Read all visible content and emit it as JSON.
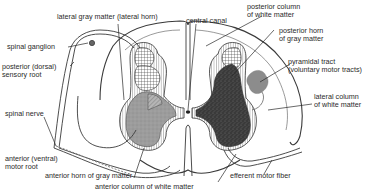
{
  "diagram": {
    "colors": {
      "outline": "#3a3a3a",
      "white_matter": "#ffffff",
      "gray_matter_light": "#a8a8a8",
      "gray_matter_dark": "#3c3c3c",
      "pyramidal_tract": "#8a8a8a",
      "label_text": "#2a2a2a"
    },
    "labels": {
      "lateral_gray_matter": "lateral gray matter (lateral horn)",
      "central_canal": "central canal",
      "posterior_column_line1": "posterior column",
      "posterior_column_line2": "of white matter",
      "posterior_horn_line1": "posterior horn",
      "posterior_horn_line2": "of gray matter",
      "pyramidal_tract_line1": "pyramidal tract",
      "pyramidal_tract_line2": "(voluntary motor tracts)",
      "spinal_ganglion": "spinal ganglion",
      "posterior_root_line1": "posterior (dorsal)",
      "posterior_root_line2": "sensory root",
      "lateral_column_line1": "lateral column",
      "lateral_column_line2": "of white matter",
      "spinal_nerve": "spinal nerve",
      "anterior_root_line1": "anterior (ventral)",
      "anterior_root_line2": "motor root",
      "anterior_horn": "anterior horn of gray matter",
      "anterior_column": "anterior column of white matter",
      "efferent_fiber": "efferent motor fiber"
    }
  }
}
